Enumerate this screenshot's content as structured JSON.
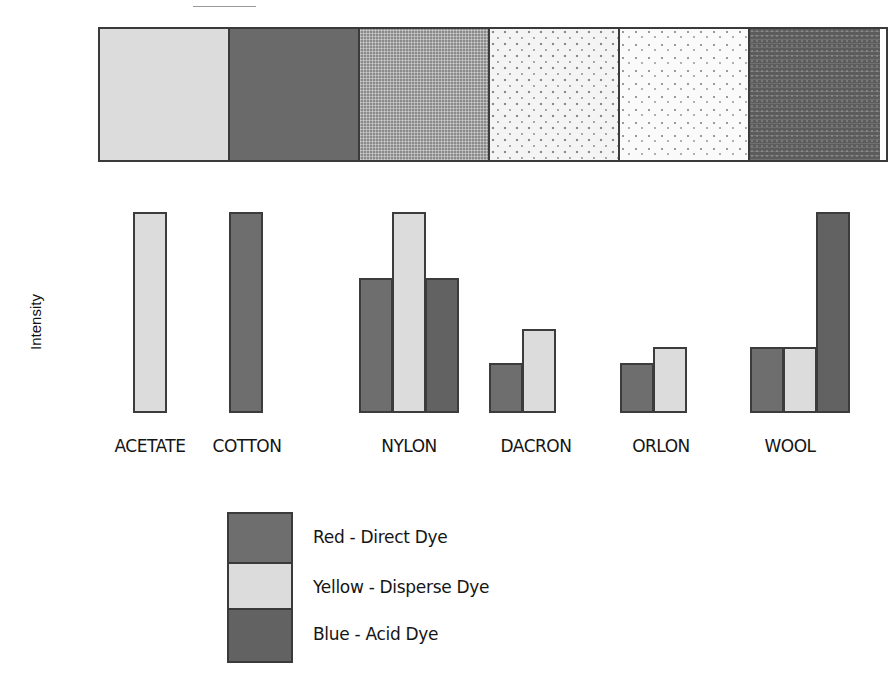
{
  "chart_data": {
    "type": "bar",
    "title": "",
    "xlabel": "",
    "ylabel": "Intensity",
    "ylim": [
      0,
      100
    ],
    "grid": false,
    "legend_position": "bottom",
    "categories": [
      "ACETATE",
      "COTTON",
      "NYLON",
      "DACRON",
      "ORLON",
      "WOOL"
    ],
    "series": [
      {
        "name": "Red - Direct Dye",
        "color": "#6e6e6e",
        "values": [
          0,
          100,
          67,
          25,
          25,
          33
        ]
      },
      {
        "name": "Yellow - Disperse Dye",
        "color": "#dcdcdc",
        "values": [
          100,
          0,
          100,
          42,
          33,
          33
        ]
      },
      {
        "name": "Blue - Acid Dye",
        "color": "#626262",
        "values": [
          0,
          0,
          67,
          0,
          0,
          100
        ]
      }
    ],
    "swatches": [
      "ACETATE",
      "COTTON",
      "NYLON",
      "DACRON",
      "ORLON",
      "WOOL"
    ]
  },
  "axis": {
    "y_label": "Intensity"
  },
  "categories": [
    {
      "label": "ACETATE"
    },
    {
      "label": "COTTON"
    },
    {
      "label": "NYLON"
    },
    {
      "label": "DACRON"
    },
    {
      "label": "ORLON"
    },
    {
      "label": "WOOL"
    }
  ],
  "legend": {
    "items": [
      {
        "label": "Red - Direct Dye"
      },
      {
        "label": "Yellow - Disperse Dye"
      },
      {
        "label": "Blue - Acid Dye"
      }
    ]
  }
}
